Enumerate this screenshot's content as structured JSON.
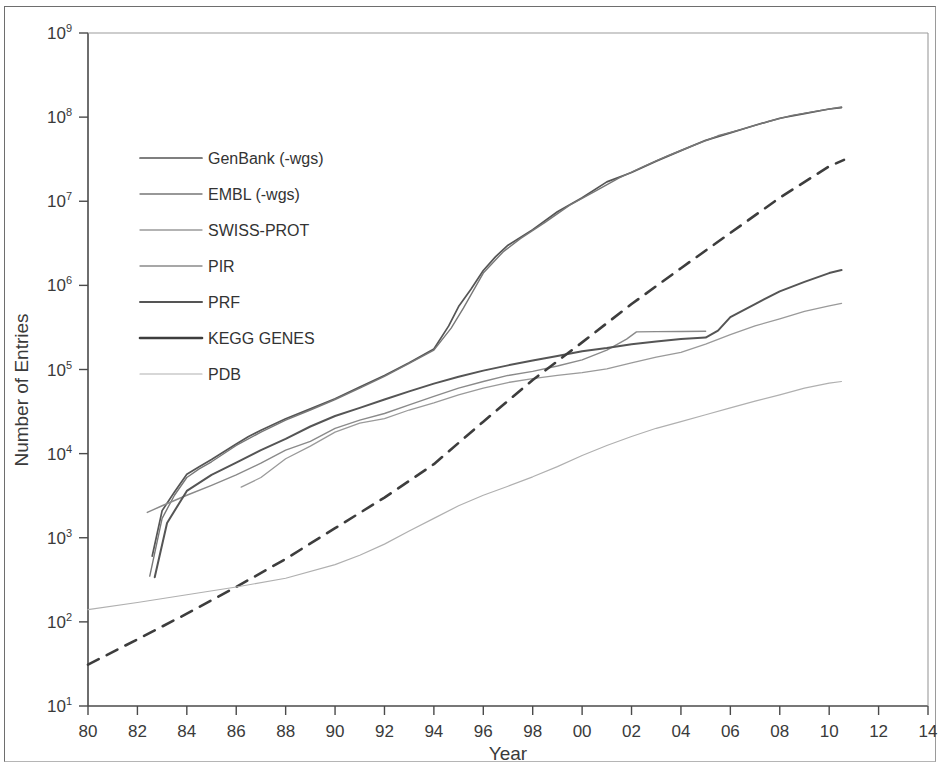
{
  "figure": {
    "background_color": "#ffffff",
    "axis_color": "#4a4a4a",
    "frame_color": "#6e6e6e"
  },
  "chart_data": {
    "type": "line",
    "title": "",
    "xlabel": "Year",
    "ylabel": "Number of Entries",
    "yscale": "log",
    "ylim": [
      10,
      1000000000
    ],
    "xlim": [
      1980,
      2014
    ],
    "grid": false,
    "legend_position": "upper-left",
    "x_tick_labels": [
      "80",
      "82",
      "84",
      "86",
      "88",
      "90",
      "92",
      "94",
      "96",
      "98",
      "00",
      "02",
      "04",
      "06",
      "08",
      "10",
      "12",
      "14"
    ],
    "x_tick_values": [
      1980,
      1982,
      1984,
      1986,
      1988,
      1990,
      1992,
      1994,
      1996,
      1998,
      2000,
      2002,
      2004,
      2006,
      2008,
      2010,
      2012,
      2014
    ],
    "y_tick_labels": [
      "10¹",
      "10²",
      "10³",
      "10⁴",
      "10⁵",
      "10⁶",
      "10⁷",
      "10⁸",
      "10⁹"
    ],
    "y_tick_mantissa": [
      "10",
      "10",
      "10",
      "10",
      "10",
      "10",
      "10",
      "10",
      "10"
    ],
    "y_tick_exponents": [
      "1",
      "2",
      "3",
      "4",
      "5",
      "6",
      "7",
      "8",
      "9"
    ],
    "y_tick_values": [
      10,
      100,
      1000,
      10000,
      100000,
      1000000,
      10000000,
      100000000,
      1000000000
    ],
    "series": [
      {
        "name": "GenBank (-wgs)",
        "color": "#555555",
        "width": 1.7,
        "dash": "none",
        "x": [
          1982.6,
          1983.0,
          1983.5,
          1984.0,
          1984.5,
          1985.0,
          1985.5,
          1986.0,
          1986.5,
          1987.0,
          1988.0,
          1989.0,
          1990.0,
          1991.0,
          1992.0,
          1993.0,
          1994.0,
          1994.6,
          1995.0,
          1995.5,
          1996.0,
          1996.5,
          1997.0,
          1998.0,
          1999.0,
          2000.0,
          2001.0,
          2002.0,
          2003.0,
          2004.0,
          2005.0,
          2006.0,
          2007.0,
          2008.0,
          2009.0,
          2010.0,
          2010.5
        ],
        "y": [
          606,
          2100,
          3500,
          5700,
          7000,
          8500,
          10500,
          13000,
          16000,
          19000,
          26000,
          34000,
          45000,
          62000,
          85000,
          120000,
          175000,
          330000,
          560000,
          900000,
          1500000,
          2200000,
          3000000,
          4600000,
          7500000,
          11000000,
          17000000,
          22000000,
          30000000,
          40000000,
          53000000,
          65000000,
          80000000,
          97000000,
          110000000,
          125000000,
          130000000
        ]
      },
      {
        "name": "EMBL (-wgs)",
        "color": "#777777",
        "width": 1.4,
        "dash": "none",
        "x": [
          1982.5,
          1983.0,
          1983.5,
          1984.0,
          1984.5,
          1985.0,
          1986.0,
          1987.0,
          1988.0,
          1989.0,
          1990.0,
          1991.0,
          1992.0,
          1993.0,
          1994.0,
          1994.7,
          1995.2,
          1996.0,
          1996.8,
          1997.5,
          1998.5,
          1999.5,
          2000.5,
          2001.5,
          2002.5,
          2003.5,
          2004.5,
          2005.5,
          2006.5,
          2007.5,
          2008.5,
          2009.5,
          2010.5
        ],
        "y": [
          350,
          1700,
          3200,
          5200,
          6600,
          8000,
          12500,
          18000,
          25000,
          33000,
          44000,
          60000,
          83000,
          118000,
          170000,
          310000,
          540000,
          1400000,
          2500000,
          3600000,
          5600000,
          9000000,
          13000000,
          19000000,
          26000000,
          35000000,
          46000000,
          60000000,
          72000000,
          88000000,
          105000000,
          118000000,
          132000000
        ]
      },
      {
        "name": "SWISS-PROT",
        "color": "#9a9a9a",
        "width": 1.3,
        "dash": "none",
        "x": [
          1986.2,
          1987.0,
          1988.0,
          1989.0,
          1990.0,
          1991.0,
          1992.0,
          1993.0,
          1994.0,
          1995.0,
          1996.0,
          1997.0,
          1998.0,
          1999.0,
          2000.0,
          2001.0,
          2002.0,
          2003.0,
          2004.0,
          2005.0,
          2006.0,
          2007.0,
          2008.0,
          2009.0,
          2010.0,
          2010.5
        ],
        "y": [
          4000,
          5200,
          8700,
          12300,
          18000,
          23000,
          26000,
          33000,
          40000,
          50000,
          60000,
          70000,
          78000,
          85000,
          92000,
          102000,
          120000,
          140000,
          160000,
          200000,
          260000,
          330000,
          400000,
          490000,
          570000,
          610000
        ]
      },
      {
        "name": "PIR",
        "color": "#8a8a8a",
        "width": 1.4,
        "dash": "none",
        "x": [
          1982.4,
          1983.0,
          1984.0,
          1985.0,
          1986.0,
          1987.0,
          1988.0,
          1989.0,
          1990.0,
          1991.0,
          1992.0,
          1993.0,
          1994.0,
          1995.0,
          1996.0,
          1997.0,
          1998.0,
          1999.0,
          2000.0,
          2001.0,
          2001.8,
          2002.2,
          2003.0,
          2004.0,
          2005.0
        ],
        "y": [
          2000,
          2400,
          3200,
          4200,
          5600,
          7700,
          11000,
          14000,
          20000,
          25000,
          30000,
          38000,
          48000,
          60000,
          72000,
          85000,
          95000,
          110000,
          130000,
          170000,
          230000,
          280000,
          282000,
          283000,
          285000
        ]
      },
      {
        "name": "PRF",
        "color": "#555555",
        "width": 2.0,
        "dash": "none",
        "x": [
          1982.7,
          1983.2,
          1984.0,
          1985.0,
          1986.0,
          1987.0,
          1988.0,
          1989.0,
          1990.0,
          1991.0,
          1992.0,
          1993.0,
          1994.0,
          1995.0,
          1996.0,
          1997.0,
          1998.0,
          1999.0,
          2000.0,
          2001.0,
          2002.0,
          2003.0,
          2004.0,
          2005.0,
          2005.5,
          2006.0,
          2007.0,
          2008.0,
          2009.0,
          2010.0,
          2010.5
        ],
        "y": [
          340,
          1500,
          3600,
          5600,
          7800,
          11000,
          15000,
          21000,
          28000,
          35000,
          44000,
          55000,
          68000,
          82000,
          97000,
          112000,
          128000,
          145000,
          165000,
          180000,
          200000,
          215000,
          230000,
          240000,
          290000,
          420000,
          600000,
          850000,
          1100000,
          1400000,
          1520000
        ]
      },
      {
        "name": "KEGG GENES",
        "color": "#3d3d3d",
        "width": 2.6,
        "dash": "12,9",
        "x": [
          1980.0,
          1982.0,
          1984.0,
          1986.0,
          1988.0,
          1990.0,
          1992.0,
          1994.0,
          1996.0,
          1998.0,
          2000.0,
          2002.0,
          2004.0,
          2006.0,
          2008.0,
          2010.0,
          2010.6
        ],
        "y": [
          31,
          62,
          125,
          260,
          560,
          1300,
          3000,
          7500,
          24000,
          75000,
          210000,
          600000,
          1600000,
          4200000,
          11000000,
          26000000,
          31000000
        ]
      },
      {
        "name": "PDB",
        "color": "#b0b0b0",
        "width": 1.2,
        "dash": "none",
        "x": [
          1980.0,
          1982.0,
          1984.0,
          1986.0,
          1988.0,
          1990.0,
          1991.0,
          1992.0,
          1993.0,
          1994.0,
          1995.0,
          1996.0,
          1997.0,
          1998.0,
          1999.0,
          2000.0,
          2001.0,
          2002.0,
          2003.0,
          2004.0,
          2005.0,
          2006.0,
          2007.0,
          2008.0,
          2009.0,
          2010.0,
          2010.5
        ],
        "y": [
          140,
          170,
          210,
          260,
          330,
          480,
          620,
          840,
          1200,
          1700,
          2400,
          3200,
          4100,
          5300,
          7000,
          9500,
          12500,
          16000,
          20000,
          24000,
          29000,
          35000,
          42000,
          50000,
          60000,
          69000,
          72000
        ]
      }
    ]
  },
  "legend": {
    "items": [
      {
        "label": "GenBank (-wgs)"
      },
      {
        "label": "EMBL (-wgs)"
      },
      {
        "label": "SWISS-PROT"
      },
      {
        "label": "PIR"
      },
      {
        "label": "PRF"
      },
      {
        "label": "KEGG GENES"
      },
      {
        "label": "PDB"
      }
    ]
  }
}
